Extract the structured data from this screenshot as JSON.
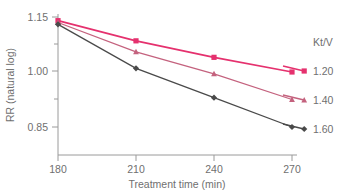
{
  "chart_data": {
    "type": "line",
    "title": "",
    "xlabel": "Treatment time (min)",
    "ylabel": "RR (natural log)",
    "x": [
      180,
      210,
      240,
      270
    ],
    "xtick_labels": [
      "180",
      "210",
      "240",
      "270"
    ],
    "xlim": [
      180,
      270
    ],
    "ytick_labels": [
      "1.15",
      "1.00",
      "0.85"
    ],
    "ytick_values": [
      1.15,
      1.0,
      0.85
    ],
    "ylim": [
      0.82,
      1.17
    ],
    "grid": false,
    "legend_position": "right",
    "legend_title": "Kt/V",
    "series": [
      {
        "name": "1.20",
        "values": [
          1.14,
          1.085,
          1.04,
          1.0
        ],
        "color": "#e5316e",
        "marker": "square"
      },
      {
        "name": "1.40",
        "values": [
          1.135,
          1.055,
          0.995,
          0.925
        ],
        "color": "#c4627e",
        "marker": "triangle"
      },
      {
        "name": "1.60",
        "values": [
          1.13,
          1.01,
          0.93,
          0.85
        ],
        "color": "#4a4a4a",
        "marker": "diamond"
      }
    ]
  },
  "axes": {
    "x_title": "Treatment time (min)",
    "y_title": "RR (natural log)",
    "x_ticks": [
      "180",
      "210",
      "240",
      "270"
    ],
    "y_ticks": [
      "1.15",
      "1.00",
      "0.85"
    ]
  },
  "legend": {
    "title": "Kt/V",
    "entries": [
      {
        "label": "1.20",
        "color": "#e5316e"
      },
      {
        "label": "1.40",
        "color": "#c4627e"
      },
      {
        "label": "1.60",
        "color": "#4a4a4a"
      }
    ]
  },
  "colors": {
    "series_1": "#e5316e",
    "series_2": "#c4627e",
    "series_3": "#4a4a4a",
    "axis": "#9a9a9a",
    "text": "#6f6f6f",
    "background": "#ffffff"
  }
}
